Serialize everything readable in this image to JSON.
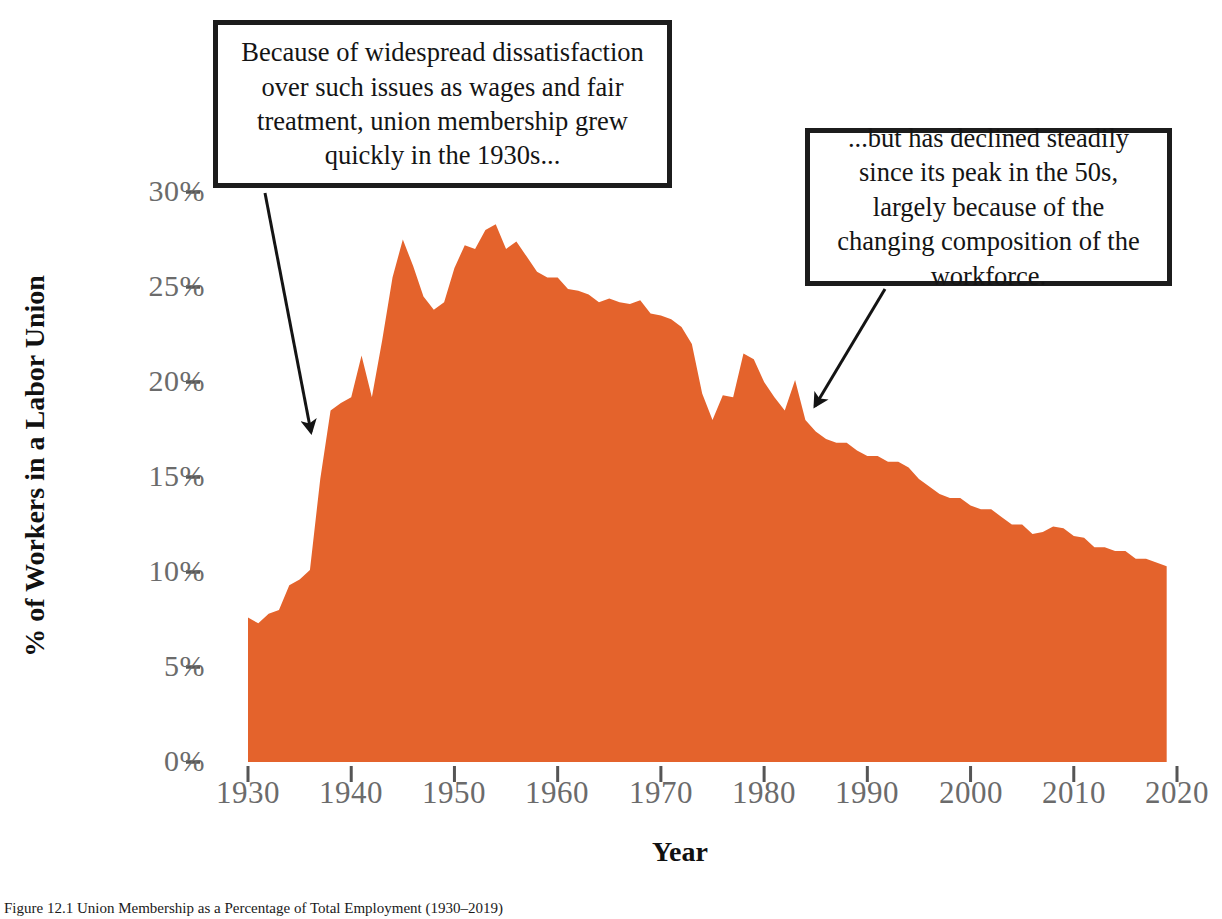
{
  "chart_data": {
    "type": "area",
    "title": "",
    "xlabel": "Year",
    "ylabel": "% of Workers in a Labor Union",
    "xlim": [
      1930,
      2020
    ],
    "ylim": [
      0,
      30
    ],
    "grid": false,
    "legend": "none",
    "series_color": "#E4632C",
    "xticks": [
      "1930",
      "1940",
      "1950",
      "1960",
      "1970",
      "1980",
      "1990",
      "2000",
      "2010",
      "2020"
    ],
    "xtick_values": [
      1930,
      1940,
      1950,
      1960,
      1970,
      1980,
      1990,
      2000,
      2010,
      2020
    ],
    "yticks": [
      "0%",
      "5%",
      "10%",
      "15%",
      "20%",
      "25%",
      "30%"
    ],
    "ytick_values": [
      0,
      5,
      10,
      15,
      20,
      25,
      30
    ],
    "series": [
      {
        "name": "Union membership share",
        "x": [
          1930,
          1931,
          1932,
          1933,
          1934,
          1935,
          1936,
          1937,
          1938,
          1939,
          1940,
          1941,
          1942,
          1943,
          1944,
          1945,
          1946,
          1947,
          1948,
          1949,
          1950,
          1951,
          1952,
          1953,
          1954,
          1955,
          1956,
          1957,
          1958,
          1959,
          1960,
          1961,
          1962,
          1963,
          1964,
          1965,
          1966,
          1967,
          1968,
          1969,
          1970,
          1971,
          1972,
          1973,
          1974,
          1975,
          1976,
          1977,
          1978,
          1979,
          1980,
          1981,
          1982,
          1983,
          1984,
          1985,
          1986,
          1987,
          1988,
          1989,
          1990,
          1991,
          1992,
          1993,
          1994,
          1995,
          1996,
          1997,
          1998,
          1999,
          2000,
          2001,
          2002,
          2003,
          2004,
          2005,
          2006,
          2007,
          2008,
          2009,
          2010,
          2011,
          2012,
          2013,
          2014,
          2015,
          2016,
          2017,
          2018,
          2019
        ],
        "values": [
          7.6,
          7.3,
          7.8,
          8.0,
          9.3,
          9.6,
          10.1,
          14.9,
          18.5,
          18.9,
          19.2,
          21.4,
          19.2,
          22.2,
          25.5,
          27.5,
          26.1,
          24.5,
          23.8,
          24.2,
          26.0,
          27.2,
          27.0,
          28.0,
          28.3,
          27.0,
          27.4,
          26.6,
          25.8,
          25.5,
          25.5,
          24.9,
          24.8,
          24.6,
          24.2,
          24.4,
          24.2,
          24.1,
          24.3,
          23.6,
          23.5,
          23.3,
          22.9,
          22.0,
          19.4,
          18.0,
          19.3,
          19.2,
          21.5,
          21.2,
          20.0,
          19.2,
          18.5,
          20.1,
          18.0,
          17.4,
          17.0,
          16.8,
          16.8,
          16.4,
          16.1,
          16.1,
          15.8,
          15.8,
          15.5,
          14.9,
          14.5,
          14.1,
          13.9,
          13.9,
          13.5,
          13.3,
          13.3,
          12.9,
          12.5,
          12.5,
          12.0,
          12.1,
          12.4,
          12.3,
          11.9,
          11.8,
          11.3,
          11.3,
          11.1,
          11.1,
          10.7,
          10.7,
          10.5,
          10.3
        ],
        "unit": "%"
      }
    ],
    "annotations": [
      {
        "id": "callout-1930s",
        "text": "Because of widespread dissatisfaction over such issues as wages and fair treatment, union membership grew quickly in the 1930s...",
        "arrow_from": [
          265,
          193
        ],
        "arrow_to": [
          311,
          432
        ]
      },
      {
        "id": "callout-decline",
        "text": "...but has declined steadily since its peak in the 50s, largely because of the changing composition of the workforce.",
        "arrow_from": [
          885,
          289
        ],
        "arrow_to": [
          815,
          406
        ]
      }
    ]
  },
  "axis": {
    "y_title": "% of Workers in a Labor Union",
    "x_title": "Year"
  },
  "caption": {
    "text": "Figure 12.1 Union Membership as a Percentage of Total Employment (1930–2019)"
  },
  "colors": {
    "area_fill": "#E4632C",
    "tick_label": "#6b6b6b",
    "axis_title": "#111111",
    "callout_border": "#1c1c1c",
    "background": "#ffffff"
  }
}
